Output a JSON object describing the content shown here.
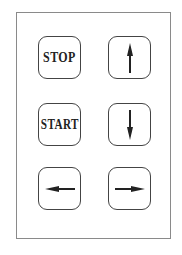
{
  "keypad": {
    "keys": [
      {
        "id": "stop",
        "label": "STOP"
      },
      {
        "id": "up",
        "icon": "arrow-up-icon"
      },
      {
        "id": "start",
        "label": "START"
      },
      {
        "id": "down",
        "icon": "arrow-down-icon"
      },
      {
        "id": "left",
        "icon": "arrow-left-icon"
      },
      {
        "id": "right",
        "icon": "arrow-right-icon"
      }
    ]
  },
  "colors": {
    "border": "#444444",
    "panel_border": "#8a8a8a",
    "text": "#222222"
  }
}
